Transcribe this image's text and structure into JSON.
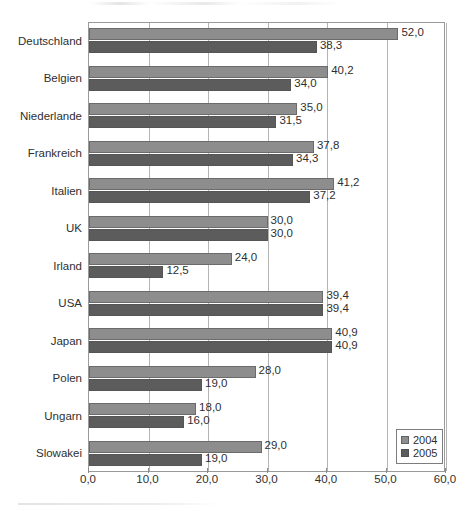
{
  "chart_data": {
    "type": "bar",
    "orientation": "horizontal",
    "title": "",
    "xlabel": "",
    "ylabel": "",
    "xlim": [
      0,
      60
    ],
    "xticks": [
      "0,0",
      "10,0",
      "20,0",
      "30,0",
      "40,0",
      "50,0",
      "60,0"
    ],
    "xtick_values": [
      0,
      10,
      20,
      30,
      40,
      50,
      60
    ],
    "grid": true,
    "legend_position": "bottom-right",
    "decimal_separator": ",",
    "categories": [
      "Deutschland",
      "Belgien",
      "Niederlande",
      "Frankreich",
      "Italien",
      "UK",
      "Irland",
      "USA",
      "Japan",
      "Polen",
      "Ungarn",
      "Slowakei"
    ],
    "series": [
      {
        "name": "2004",
        "color": "#8d8d8d",
        "values": [
          52.0,
          40.2,
          35.0,
          37.8,
          41.2,
          30.0,
          24.0,
          39.4,
          40.9,
          28.0,
          18.0,
          29.0
        ],
        "labels": [
          "52,0",
          "40,2",
          "35,0",
          "37,8",
          "41,2",
          "30,0",
          "24,0",
          "39,4",
          "40,9",
          "28,0",
          "18,0",
          "29,0"
        ]
      },
      {
        "name": "2005",
        "color": "#5c5c5c",
        "values": [
          38.3,
          34.0,
          31.5,
          34.3,
          37.2,
          30.0,
          12.5,
          39.4,
          40.9,
          19.0,
          16.0,
          19.0
        ],
        "labels": [
          "38,3",
          "34,0",
          "31,5",
          "34,3",
          "37,2",
          "30,0",
          "12,5",
          "39,4",
          "40,9",
          "19,0",
          "16,0",
          "19,0"
        ]
      }
    ]
  },
  "legend": {
    "items": [
      {
        "label": "2004",
        "color": "#8d8d8d"
      },
      {
        "label": "2005",
        "color": "#5c5c5c"
      }
    ]
  }
}
